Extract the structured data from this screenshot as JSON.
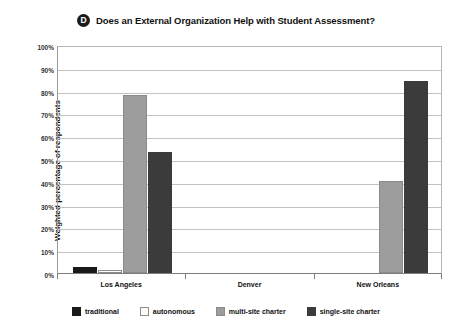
{
  "title": {
    "badge": "D",
    "text": "Does an External Organization Help with Student Assessment?"
  },
  "chart_data": {
    "type": "bar",
    "title": "Does an External Organization Help with Student Assessment?",
    "xlabel": "",
    "ylabel": "Weighted percentage of respondents",
    "ylim": [
      0,
      100
    ],
    "ytick_labels": [
      "0%",
      "10%",
      "20%",
      "30%",
      "40%",
      "50%",
      "60%",
      "70%",
      "80%",
      "90%",
      "100%"
    ],
    "ytick_values": [
      0,
      10,
      20,
      30,
      40,
      50,
      60,
      70,
      80,
      90,
      100
    ],
    "grid": true,
    "legend_position": "bottom",
    "categories": [
      "Los Angeles",
      "Denver",
      "New Orleans"
    ],
    "series": [
      {
        "name": "traditional",
        "color": "#1a1a1a",
        "values": [
          2.5,
          0,
          0
        ]
      },
      {
        "name": "autonomous",
        "color": "#fbfbfb",
        "values": [
          1.5,
          0,
          0
        ]
      },
      {
        "name": "multi-site charter",
        "color": "#9d9d9d",
        "values": [
          78,
          0,
          40.5
        ]
      },
      {
        "name": "single-site charter",
        "color": "#3b3b3b",
        "values": [
          53,
          0,
          84
        ]
      }
    ]
  }
}
